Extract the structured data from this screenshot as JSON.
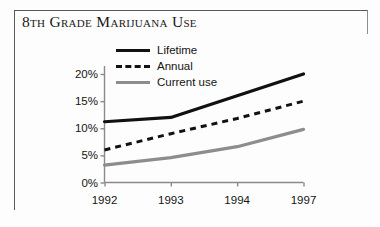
{
  "title": "8th Grade Marijuana Use",
  "legend": {
    "items": [
      {
        "label": "Lifetime",
        "style": "solid",
        "color": "#111111",
        "icon": "line-solid-icon"
      },
      {
        "label": "Annual",
        "style": "dashed",
        "color": "#111111",
        "icon": "line-dashed-icon"
      },
      {
        "label": "Current use",
        "style": "solid",
        "color": "#8d8d8d",
        "icon": "line-solid-gray-icon"
      }
    ]
  },
  "chart_data": {
    "type": "line",
    "title": "8th Grade Marijuana Use",
    "xlabel": "",
    "ylabel": "",
    "categories": [
      "1992",
      "1993",
      "1994",
      "1997"
    ],
    "x_tick_labels": [
      "1992",
      "1993",
      "1994",
      "1997"
    ],
    "y_tick_labels": [
      "0%",
      "5%",
      "10%",
      "15%",
      "20%"
    ],
    "y_ticks": [
      0,
      5,
      10,
      15,
      20
    ],
    "ylim": [
      0,
      22
    ],
    "grid": false,
    "legend_position": "top-center",
    "series": [
      {
        "name": "Lifetime",
        "color": "#111111",
        "style": "solid",
        "values": [
          11.2,
          12.0,
          16.0,
          20.0
        ]
      },
      {
        "name": "Annual",
        "color": "#111111",
        "style": "dashed",
        "values": [
          6.0,
          9.0,
          11.8,
          15.0
        ]
      },
      {
        "name": "Current use",
        "color": "#8d8d8d",
        "style": "solid",
        "values": [
          3.2,
          4.6,
          6.6,
          9.8
        ]
      }
    ]
  },
  "axis": {
    "y_labels": [
      {
        "text": "20%",
        "value": 20
      },
      {
        "text": "15%",
        "value": 15
      },
      {
        "text": "10%",
        "value": 10
      },
      {
        "text": "5%",
        "value": 5
      },
      {
        "text": "0%",
        "value": 0
      }
    ],
    "x_labels": [
      {
        "text": "1992",
        "index": 0
      },
      {
        "text": "1993",
        "index": 1
      },
      {
        "text": "1994",
        "index": 2
      },
      {
        "text": "1997",
        "index": 3
      }
    ]
  }
}
